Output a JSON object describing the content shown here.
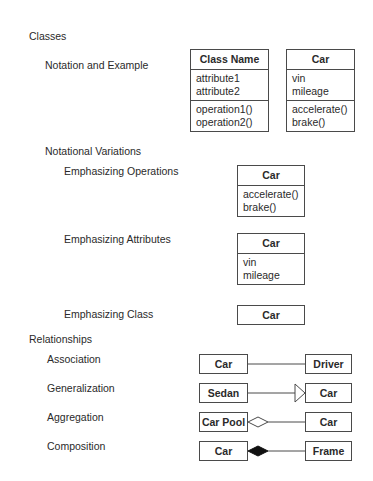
{
  "sections": {
    "classes": "Classes",
    "notation": "Notation and Example",
    "variations": "Notational Variations",
    "emph_ops": "Emphasizing Operations",
    "emph_attrs": "Emphasizing Attributes",
    "emph_class": "Emphasizing Class",
    "relationships": "Relationships",
    "association": "Association",
    "generalization": "Generalization",
    "aggregation": "Aggregation",
    "composition": "Composition"
  },
  "generic_class": {
    "name": "Class Name",
    "attributes": [
      "attribute1",
      "attribute2"
    ],
    "operations": [
      "operation1()",
      "operation2()"
    ]
  },
  "car_class": {
    "name": "Car",
    "attributes": [
      "vin",
      "mileage"
    ],
    "operations": [
      "accelerate()",
      "brake()"
    ]
  },
  "relations": {
    "association": {
      "from": "Car",
      "to": "Driver"
    },
    "generalization": {
      "from": "Sedan",
      "to": "Car"
    },
    "aggregation": {
      "from": "Car Pool",
      "to": "Car"
    },
    "composition": {
      "from": "Car",
      "to": "Frame"
    }
  }
}
